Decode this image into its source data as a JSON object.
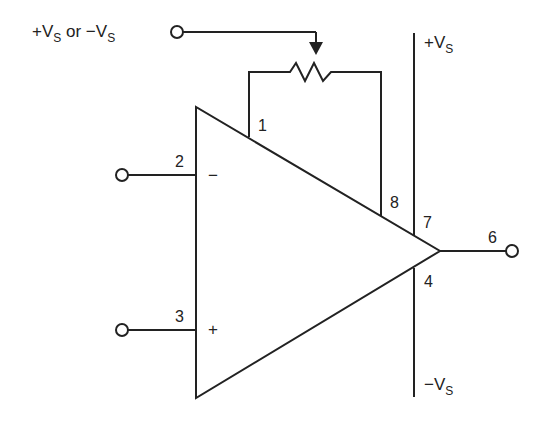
{
  "diagram": {
    "type": "op-amp offset null circuit",
    "supply_input_label": "+V",
    "supply_input_sub": "S",
    "supply_input_or": " or ",
    "supply_input_label2": "−V",
    "supply_input_sub2": "S",
    "pos_rail_label": "+V",
    "pos_rail_sub": "S",
    "neg_rail_label": "−V",
    "neg_rail_sub": "S",
    "pins": {
      "p1": "1",
      "p2": "2",
      "p3": "3",
      "p4": "4",
      "p6": "6",
      "p7": "7",
      "p8": "8"
    },
    "inverting_symbol": "−",
    "noninverting_symbol": "+",
    "line_color": "#222222"
  }
}
